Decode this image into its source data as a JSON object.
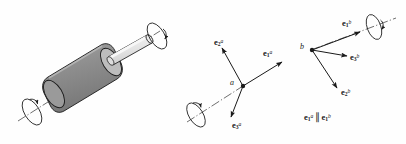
{
  "figure": {
    "background_color": "#fefefe",
    "ink_color": "#1a1a1a"
  },
  "panels": [
    {
      "id": "shaft-panel",
      "name": "rotating-shaft-illustration",
      "description": "Shaded cylindrical rotor on an inclined shaft with rotation arrows at both ends",
      "parts": {
        "rotor_body_label": "rotor",
        "shaft_label": "shaft",
        "axis_label": "axis of rotation"
      },
      "colors": {
        "rotor_fill": "#8f8f8f",
        "rotor_endcap_fill": "#b4b4b4",
        "shaft_fill": "#e8e8e8",
        "shaft_top_fill": "#f4f4f4",
        "outline": "#1a1a1a"
      },
      "rotation_indicators": [
        {
          "name": "rotation-ellipse-left",
          "position": "lower-left end of axis"
        },
        {
          "name": "rotation-ellipse-right",
          "position": "upper-right end of axis"
        }
      ]
    },
    {
      "id": "triad-a-panel",
      "name": "unit-vector-triad-at-a",
      "point_label": "a",
      "vectors": [
        {
          "name": "vector-e1-a",
          "symbol": "e",
          "subscript": "1",
          "superscript": "a",
          "direction": "up-right along rotation axis"
        },
        {
          "name": "vector-e2-a",
          "symbol": "e",
          "subscript": "2",
          "superscript": "a",
          "direction": "up-left"
        },
        {
          "name": "vector-e3-a",
          "symbol": "e",
          "subscript": "3",
          "superscript": "a",
          "direction": "down-left"
        }
      ],
      "rotation_indicators": [
        {
          "name": "rotation-ellipse-a",
          "position": "lower-left on the axis through a"
        }
      ]
    },
    {
      "id": "triad-b-panel",
      "name": "unit-vector-triad-at-b",
      "point_label": "b",
      "vectors": [
        {
          "name": "vector-e1-b",
          "symbol": "e",
          "subscript": "1",
          "superscript": "b",
          "direction": "up-right along rotation axis"
        },
        {
          "name": "vector-e3-b",
          "symbol": "e",
          "subscript": "3",
          "superscript": "b",
          "direction": "right"
        },
        {
          "name": "vector-e2-b",
          "symbol": "e",
          "subscript": "2",
          "superscript": "b",
          "direction": "down-right"
        }
      ],
      "rotation_indicators": [
        {
          "name": "rotation-ellipse-b",
          "position": "upper-right on the axis through b"
        }
      ]
    }
  ],
  "equation": {
    "name": "parallel-relation",
    "text": "e1a || e1b",
    "left": {
      "symbol": "e",
      "subscript": "1",
      "superscript": "a"
    },
    "operator": "∥",
    "right": {
      "symbol": "e",
      "subscript": "1",
      "superscript": "b"
    }
  }
}
